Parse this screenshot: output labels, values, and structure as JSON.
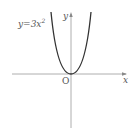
{
  "diagram": {
    "function_label": "y=3x",
    "function_exponent": "2",
    "y_axis_label": "y",
    "x_axis_label": "x",
    "origin_label": "O",
    "colors": {
      "curve": "#333333",
      "axes": "#888888",
      "text": "#555555"
    }
  }
}
